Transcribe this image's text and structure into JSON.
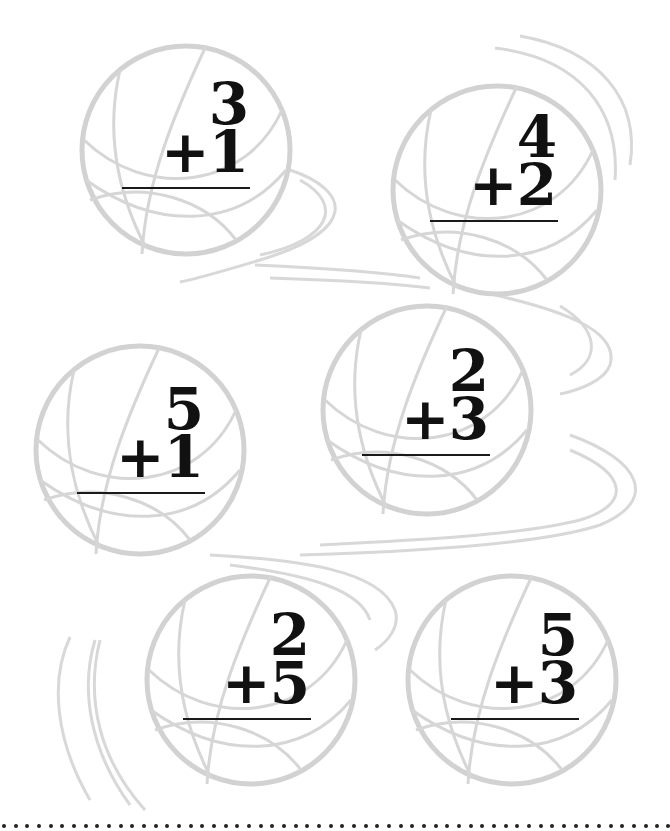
{
  "worksheet": {
    "type": "addition-practice",
    "theme": "basketball",
    "colors": {
      "ball_outline": "#d4d4d4",
      "text": "#111111",
      "rule": "#1a1a1a",
      "dots": "#222222"
    },
    "problems": [
      {
        "id": 1,
        "top": "3",
        "bottom": "+1",
        "answer": ""
      },
      {
        "id": 2,
        "top": "4",
        "bottom": "+2",
        "answer": ""
      },
      {
        "id": 3,
        "top": "5",
        "bottom": "+1",
        "answer": ""
      },
      {
        "id": 4,
        "top": "2",
        "bottom": "+3",
        "answer": ""
      },
      {
        "id": 5,
        "top": "2",
        "bottom": "+5",
        "answer": ""
      },
      {
        "id": 6,
        "top": "5",
        "bottom": "+3",
        "answer": ""
      }
    ],
    "footer": {
      "style": "dotted-cut-line"
    }
  }
}
